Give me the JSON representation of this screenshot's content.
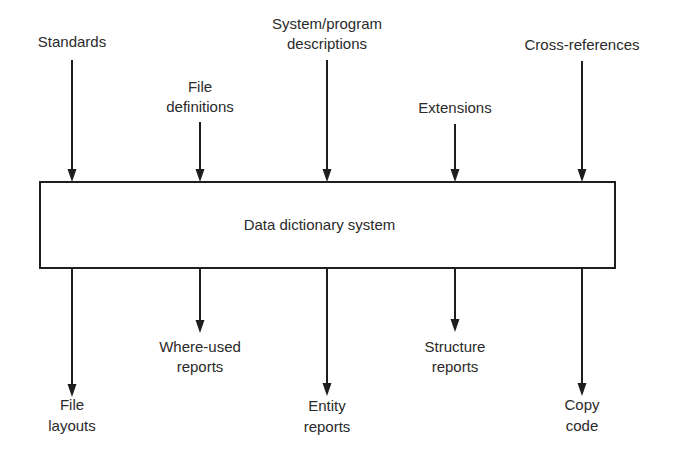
{
  "diagram": {
    "central_box": {
      "label": "Data dictionary system",
      "x": 40,
      "y": 182,
      "width": 575,
      "height": 86
    },
    "inputs": [
      {
        "lines": [
          "Standards"
        ],
        "x": 72,
        "label_y": [
          47
        ],
        "arrow_start_y": 60
      },
      {
        "lines": [
          "File",
          "definitions"
        ],
        "x": 200,
        "label_y": [
          92,
          112
        ],
        "arrow_start_y": 122
      },
      {
        "lines": [
          "System/program",
          "descriptions"
        ],
        "x": 327,
        "label_y": [
          29,
          49
        ],
        "arrow_start_y": 60
      },
      {
        "lines": [
          "Extensions"
        ],
        "x": 455,
        "label_y": [
          113
        ],
        "arrow_start_y": 124
      },
      {
        "lines": [
          "Cross-references"
        ],
        "x": 582,
        "label_y": [
          50
        ],
        "arrow_start_y": 61
      }
    ],
    "outputs": [
      {
        "lines": [
          "File",
          "layouts"
        ],
        "x": 72,
        "label_y": [
          410,
          431
        ],
        "arrow_end_y": 397
      },
      {
        "lines": [
          "Where-used",
          "reports"
        ],
        "x": 200,
        "label_y": [
          352,
          372
        ],
        "arrow_end_y": 333
      },
      {
        "lines": [
          "Entity",
          "reports"
        ],
        "x": 327,
        "label_y": [
          411,
          432
        ],
        "arrow_end_y": 396
      },
      {
        "lines": [
          "Structure",
          "reports"
        ],
        "x": 455,
        "label_y": [
          352,
          372
        ],
        "arrow_end_y": 332
      },
      {
        "lines": [
          "Copy",
          "code"
        ],
        "x": 582,
        "label_y": [
          410,
          431
        ],
        "arrow_end_y": 396
      }
    ],
    "colors": {
      "line": "#1e1e1e",
      "text": "#2a2a2a",
      "background": "#ffffff"
    }
  }
}
